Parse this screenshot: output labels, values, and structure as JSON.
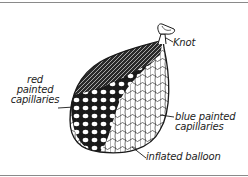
{
  "diagram": {
    "labels": {
      "knot": "Knot",
      "red_capillaries": [
        "red",
        "painted",
        "capillaries"
      ],
      "blue_capillaries": [
        "blue painted",
        "capillaries"
      ],
      "inflated_balloon": "inflated balloon"
    },
    "colors": {
      "ink": "#1a1a1a",
      "background": "#ffffff",
      "border_rule": "#8a8a8a"
    }
  }
}
